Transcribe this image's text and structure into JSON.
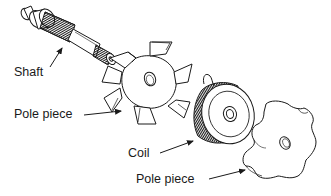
{
  "diagram": {
    "type": "exploded-view",
    "components": [
      {
        "id": "shaft",
        "label": "Shaft"
      },
      {
        "id": "pole-piece-front",
        "label": "Pole piece"
      },
      {
        "id": "coil",
        "label": "Coil"
      },
      {
        "id": "pole-piece-rear",
        "label": "Pole piece"
      }
    ]
  },
  "labels": {
    "shaft": "Shaft",
    "pole_piece_1": "Pole piece",
    "coil": "Coil",
    "pole_piece_2": "Pole piece"
  },
  "colors": {
    "line": "#1a1a1a",
    "background": "#ffffff"
  }
}
